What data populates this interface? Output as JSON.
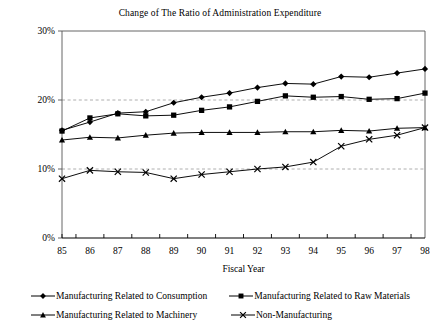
{
  "chart_data": {
    "type": "line",
    "title": "Change of The Ratio of Administration Expenditure",
    "xlabel": "Fiscal Year",
    "ylabel": "",
    "categories": [
      "85",
      "86",
      "87",
      "88",
      "89",
      "90",
      "91",
      "92",
      "93",
      "94",
      "95",
      "96",
      "97",
      "98"
    ],
    "x": [
      85,
      86,
      87,
      88,
      89,
      90,
      91,
      92,
      93,
      94,
      95,
      96,
      97,
      98
    ],
    "ylim": [
      0,
      30
    ],
    "yticks": [
      0,
      10,
      20,
      30
    ],
    "ytick_labels": [
      "0%",
      "10%",
      "20%",
      "30%"
    ],
    "grid": "horizontal-dashed-at-10-and-20",
    "legend_position": "bottom",
    "series": [
      {
        "name": "Manufacturing Related to Consumption",
        "marker": "diamond",
        "values": [
          15.6,
          16.8,
          18.1,
          18.3,
          19.6,
          20.4,
          21.0,
          21.8,
          22.4,
          22.3,
          23.4,
          23.3,
          23.9,
          24.5
        ]
      },
      {
        "name": "Manufacturing Related to Raw Materials",
        "marker": "square",
        "values": [
          15.5,
          17.4,
          18.0,
          17.7,
          17.8,
          18.5,
          19.0,
          19.8,
          20.6,
          20.4,
          20.5,
          20.1,
          20.2,
          21.0
        ]
      },
      {
        "name": "Manufacturing Related to Machinery",
        "marker": "triangle",
        "values": [
          14.2,
          14.6,
          14.5,
          14.9,
          15.2,
          15.3,
          15.3,
          15.3,
          15.4,
          15.4,
          15.6,
          15.5,
          15.9,
          16.0
        ]
      },
      {
        "name": "Non-Manufacturing",
        "marker": "cross",
        "values": [
          8.6,
          9.8,
          9.6,
          9.5,
          8.6,
          9.2,
          9.6,
          10.0,
          10.3,
          11.0,
          13.3,
          14.3,
          14.9,
          16.0
        ]
      }
    ]
  },
  "legend": {
    "items": [
      {
        "label": "Manufacturing Related to Consumption",
        "marker": "diamond"
      },
      {
        "label": "Manufacturing Related to Raw Materials",
        "marker": "square"
      },
      {
        "label": "Manufacturing Related to Machinery",
        "marker": "triangle"
      },
      {
        "label": "Non-Manufacturing",
        "marker": "cross"
      }
    ]
  },
  "colors": {
    "line": "#000000",
    "marker": "#000000",
    "axis": "#555555",
    "grid": "#999999",
    "background": "#ffffff"
  }
}
